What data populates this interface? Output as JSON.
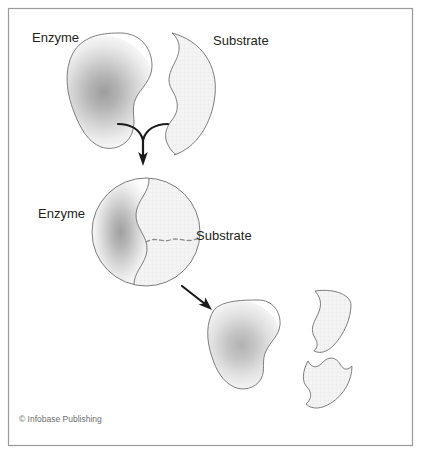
{
  "figure": {
    "credit": "© Infobase Publishing",
    "colors": {
      "outline": "#7d7d7d",
      "frame": "#9a9a9a",
      "arrow": "#1a1a1a",
      "label_text": "#231f20",
      "credit_text": "#6f6f6f",
      "substrate_fill": "#f2f2f2",
      "enzyme_core": "#9d9d9d",
      "background": "#ffffff"
    },
    "stages": [
      {
        "id": "stage-1-separate",
        "labels": [
          {
            "id": "label-enzyme-top",
            "text": "Enzyme"
          },
          {
            "id": "label-substrate-top",
            "text": "Substrate"
          }
        ]
      },
      {
        "id": "stage-2-complex",
        "labels": [
          {
            "id": "label-enzyme-complex",
            "text": "Enzyme"
          },
          {
            "id": "label-substrate-complex",
            "text": "Substrate"
          }
        ]
      },
      {
        "id": "stage-3-products",
        "labels": []
      }
    ],
    "arrows": [
      {
        "id": "merge-arrow",
        "shape": "y-merge",
        "direction": "down"
      },
      {
        "id": "products-arrow",
        "shape": "straight",
        "direction": "down-right"
      }
    ]
  }
}
